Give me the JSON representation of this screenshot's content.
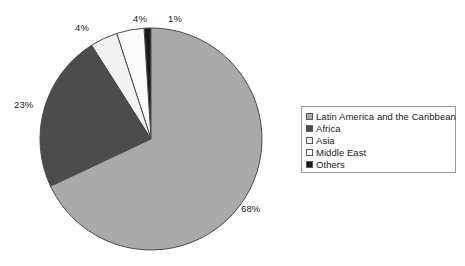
{
  "chart_data": {
    "type": "pie",
    "title": "",
    "categories": [
      "Latin America and the Caribbean",
      "Africa",
      "Asia",
      "Middle East",
      "Others"
    ],
    "values": [
      68,
      23,
      4,
      4,
      1
    ],
    "value_unit": "%",
    "data_labels": [
      "68%",
      "23%",
      "4%",
      "4%",
      "1%"
    ],
    "colors": [
      "#a9a9a9",
      "#4c4c4c",
      "#f2f2f2",
      "#fbfbfb",
      "#1a1a1a"
    ],
    "legend_position": "right",
    "grid": false,
    "start_angle_deg": 0,
    "direction": "counter-clockwise",
    "slice_order_from_12oclock_ccw": [
      "Others",
      "Middle East",
      "Asia",
      "Africa",
      "Latin America and the Caribbean"
    ]
  },
  "chart": {
    "slices": [
      {
        "name": "Latin America and the Caribbean",
        "label": "68%",
        "value": 68,
        "color": "#a9a9a9",
        "label_x": 241,
        "label_y": 203
      },
      {
        "name": "Africa",
        "label": "23%",
        "value": 23,
        "color": "#4c4c4c",
        "label_x": 14,
        "label_y": 99
      },
      {
        "name": "Asia",
        "label": "4%",
        "value": 4,
        "color": "#f2f2f2",
        "label_x": 75,
        "label_y": 22
      },
      {
        "name": "Middle East",
        "label": "4%",
        "value": 4,
        "color": "#fbfbfb",
        "label_x": 133,
        "label_y": 13
      },
      {
        "name": "Others",
        "label": "1%",
        "value": 1,
        "color": "#1a1a1a",
        "label_x": 168,
        "label_y": 13
      }
    ],
    "geometry": {
      "cx": 151,
      "cy": 139,
      "r": 111
    },
    "outline_color": "#4a4a4a"
  },
  "legend": {
    "border_color": "#9a9a9a",
    "items": [
      {
        "label": "Latin America and the Caribbean",
        "color": "#a9a9a9"
      },
      {
        "label": "Africa",
        "color": "#4c4c4c"
      },
      {
        "label": "Asia",
        "color": "#f2f2f2"
      },
      {
        "label": "Middle East",
        "color": "#fbfbfb"
      },
      {
        "label": "Others",
        "color": "#1a1a1a"
      }
    ]
  }
}
